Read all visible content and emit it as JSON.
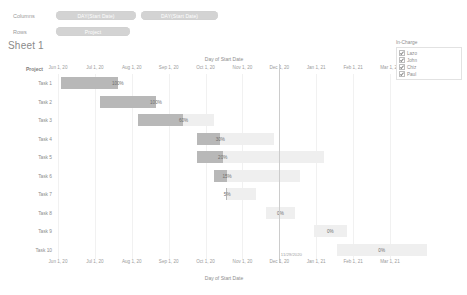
{
  "shelves": {
    "columns_label": "Columns",
    "rows_label": "Rows",
    "columns_pills": [
      {
        "label": "DAY(Start Date)"
      },
      {
        "label": "DAY(Start Date)"
      }
    ],
    "rows_pills": [
      {
        "label": "Project"
      }
    ]
  },
  "sheet": {
    "title": "Sheet 1"
  },
  "viz": {
    "axis_title_top": "Day of Start Date",
    "axis_title_bottom": "Day of Start Date",
    "row_header_title": "Project",
    "reference_line_label": "11/29/2020"
  },
  "legend": {
    "title": "In-Charge",
    "items": [
      {
        "label": "Lazo",
        "checked": true
      },
      {
        "label": "John",
        "checked": true
      },
      {
        "label": "Chiz",
        "checked": true
      },
      {
        "label": "Paul",
        "checked": true
      }
    ]
  },
  "chart_data": {
    "type": "bar",
    "title": "Sheet 1",
    "xlabel": "Day of Start Date",
    "ylabel": "Project",
    "grid": true,
    "legend_position": "right",
    "x_ticks": [
      "Jun 1, 20",
      "Jul 1, 20",
      "Aug 1, 20",
      "Sep 1, 20",
      "Oct 1, 20",
      "Nov 1, 20",
      "Dec 1, 20",
      "Jan 1, 21",
      "Feb 1, 21",
      "Mar 1, 21"
    ],
    "categories": [
      "Task 1",
      "Task 2",
      "Task 3",
      "Task 4",
      "Task 5",
      "Task 6",
      "Task 7",
      "Task 8",
      "Task 9",
      "Task 10"
    ],
    "series": [
      {
        "name": "Planned duration",
        "values": [
          100,
          100,
          100,
          100,
          100,
          100,
          100,
          100,
          100,
          100
        ]
      },
      {
        "name": "Percent complete",
        "values": [
          100,
          100,
          60,
          30,
          20,
          15,
          5,
          0,
          0,
          0
        ]
      }
    ],
    "bar_labels": [
      "100%",
      "100%",
      "60%",
      "30%",
      "20%",
      "15%",
      "5%",
      "0%",
      "0%",
      "0%"
    ],
    "reference_line": {
      "value": "11/29/2020",
      "label": "11/29/2020"
    },
    "bars": [
      {
        "category": "Task 1",
        "start_pct": 1.0,
        "length_pct": 17.0,
        "fill_pct": 100,
        "label": "100%"
      },
      {
        "category": "Task 2",
        "start_pct": 12.5,
        "length_pct": 17.0,
        "fill_pct": 100,
        "label": "100%"
      },
      {
        "category": "Task 3",
        "start_pct": 24.0,
        "length_pct": 23.0,
        "fill_pct": 60,
        "label": "60%"
      },
      {
        "category": "Task 4",
        "start_pct": 42.0,
        "length_pct": 23.0,
        "fill_pct": 30,
        "label": "30%"
      },
      {
        "category": "Task 5",
        "start_pct": 42.0,
        "length_pct": 38.0,
        "fill_pct": 20,
        "label": "20%"
      },
      {
        "category": "Task 6",
        "start_pct": 47.0,
        "length_pct": 26.0,
        "fill_pct": 15,
        "label": "15%"
      },
      {
        "category": "Task 7",
        "start_pct": 50.5,
        "length_pct": 9.0,
        "fill_pct": 5,
        "label": "5%"
      },
      {
        "category": "Task 8",
        "start_pct": 62.5,
        "length_pct": 9.0,
        "fill_pct": 0,
        "label": "0%"
      },
      {
        "category": "Task 9",
        "start_pct": 77.0,
        "length_pct": 10.0,
        "fill_pct": 0,
        "label": "0%"
      },
      {
        "category": "Task 10",
        "start_pct": 84.0,
        "length_pct": 27.0,
        "fill_pct": 0,
        "label": "0%"
      }
    ]
  }
}
